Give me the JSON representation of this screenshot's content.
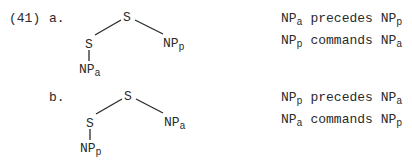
{
  "example": {
    "number": "(41)",
    "items": [
      {
        "label": "a.",
        "tree": {
          "root": "S",
          "left_child": "S",
          "right_child": {
            "base": "NP",
            "sub": "p"
          },
          "left_grandchild": {
            "base": "NP",
            "sub": "a"
          }
        },
        "statements": [
          {
            "np1": {
              "base": "NP",
              "sub": "a"
            },
            "relation": "precedes",
            "np2": {
              "base": "NP",
              "sub": "p"
            }
          },
          {
            "np1": {
              "base": "NP",
              "sub": "p"
            },
            "relation": "commands",
            "np2": {
              "base": "NP",
              "sub": "a"
            }
          }
        ]
      },
      {
        "label": "b.",
        "tree": {
          "root": "S",
          "left_child": "S",
          "right_child": {
            "base": "NP",
            "sub": "a"
          },
          "left_grandchild": {
            "base": "NP",
            "sub": "p"
          }
        },
        "statements": [
          {
            "np1": {
              "base": "NP",
              "sub": "p"
            },
            "relation": "precedes",
            "np2": {
              "base": "NP",
              "sub": "a"
            }
          },
          {
            "np1": {
              "base": "NP",
              "sub": "a"
            },
            "relation": "commands",
            "np2": {
              "base": "NP",
              "sub": "p"
            }
          }
        ]
      }
    ]
  }
}
